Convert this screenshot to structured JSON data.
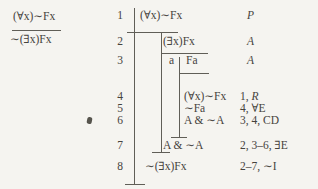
{
  "argument": {
    "premise": "(∀x)∼Fx",
    "conclusion": "∼(∃x)Fx"
  },
  "proof": {
    "rows": [
      {
        "num": "1",
        "formula": "(∀x)∼Fx",
        "refs": "",
        "rule": "P"
      },
      {
        "num": "2",
        "formula": "(∃x)Fx",
        "refs": "",
        "rule": "A"
      },
      {
        "num": "3",
        "flag": "a",
        "formula": "Fa",
        "refs": "",
        "rule": "A"
      },
      {
        "num": "4",
        "formula": "(∀x)∼Fx",
        "refs": "1, ",
        "rule": "R"
      },
      {
        "num": "5",
        "formula": "∼Fa",
        "refs": "4, ",
        "rule": "∀E"
      },
      {
        "num": "6",
        "formula": "A & ∼A",
        "refs": "3, 4, ",
        "rule": "CD"
      },
      {
        "num": "7",
        "formula": "A & ∼A",
        "refs": "2, 3–6, ",
        "rule": "∃E"
      },
      {
        "num": "8",
        "formula": "∼(∃x)Fx",
        "refs": "2–7, ",
        "rule": "∼I"
      }
    ]
  }
}
